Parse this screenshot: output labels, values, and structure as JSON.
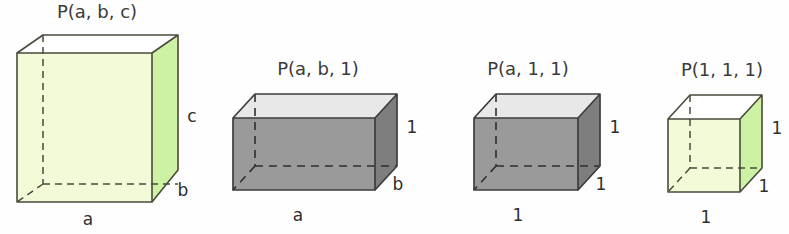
{
  "figure": {
    "background_color": "#fefefe",
    "boxes": [
      {
        "id": "box-abc",
        "title": "P(a, b, c)",
        "width_label": "a",
        "depth_label": "b",
        "height_label": "c",
        "front_face_color": "#f2fbd8",
        "side_face_color": "#cdf2a4",
        "top_face_color": "#ffffff",
        "edge_color": "#4a4a3c"
      },
      {
        "id": "box-ab1",
        "title": "P(a, b, 1)",
        "width_label": "a",
        "depth_label": "b",
        "height_label": "1",
        "front_face_color": "#9a9a9a",
        "side_face_color": "#7e7e7e",
        "top_face_color": "#e8e8e8",
        "edge_color": "#3d3d3d"
      },
      {
        "id": "box-a11",
        "title": "P(a, 1, 1)",
        "width_label": "1",
        "depth_label": "1",
        "height_label": "1",
        "front_face_color": "#9a9a9a",
        "side_face_color": "#7e7e7e",
        "top_face_color": "#e8e8e8",
        "edge_color": "#3d3d3d"
      },
      {
        "id": "box-111",
        "title": "P(1, 1, 1)",
        "width_label": "1",
        "depth_label": "1",
        "height_label": "1",
        "front_face_color": "#f2fbd8",
        "side_face_color": "#cdf2a4",
        "top_face_color": "#ffffff",
        "edge_color": "#4a4a3c"
      }
    ]
  }
}
